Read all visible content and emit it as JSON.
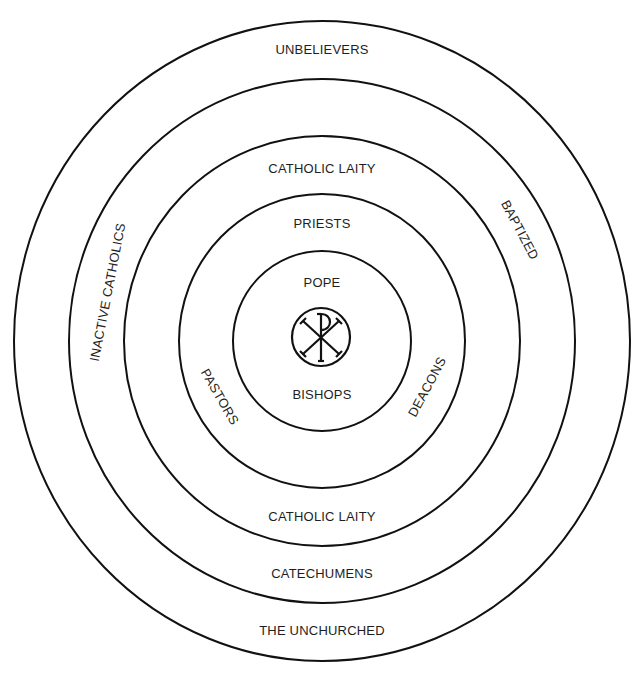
{
  "diagram": {
    "type": "concentric-rings",
    "colors": {
      "line": "#111111",
      "text": "#1e1e1e",
      "background": "#ffffff"
    },
    "center_symbol": "chi-rho-icon",
    "rings": [
      {
        "level": 1,
        "labels": {
          "top": "UNBELIEVERS",
          "bottom": "THE UNCHURCHED"
        }
      },
      {
        "level": 2,
        "labels": {
          "left": "INACTIVE CATHOLICS",
          "right": "BAPTIZED",
          "bottom": "CATECHUMENS"
        }
      },
      {
        "level": 3,
        "labels": {
          "top": "CATHOLIC LAITY",
          "bottom": "CATHOLIC LAITY"
        }
      },
      {
        "level": 4,
        "labels": {
          "top": "PRIESTS",
          "left": "PASTORS",
          "right": "DEACONS"
        }
      },
      {
        "level": 5,
        "labels": {
          "top": "POPE",
          "bottom": "BISHOPS"
        }
      }
    ]
  }
}
